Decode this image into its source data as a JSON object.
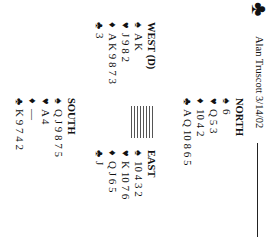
{
  "header": {
    "icon": "club-icon",
    "icon_glyph": "♣",
    "byline": "Alan Truscott 3/14/02"
  },
  "suits": {
    "spades": "♠",
    "hearts": "♥",
    "diamonds": "♦",
    "clubs": "♣"
  },
  "hands": {
    "north": {
      "name": "NORTH",
      "spades": "6",
      "hearts": "Q 5 3",
      "diamonds": "10 4 2",
      "clubs": "A Q 10 8 6 5"
    },
    "west": {
      "name": "WEST (D)",
      "spades": "A K",
      "hearts": "J 9 8 2",
      "diamonds": "A K 9 8 7 3",
      "clubs": "3"
    },
    "east": {
      "name": "EAST",
      "spades": "10 4 3 2",
      "hearts": "K 10 7 6",
      "diamonds": "Q J 6 5",
      "clubs": "J"
    },
    "south": {
      "name": "SOUTH",
      "spades": "Q J 9 8 7 5",
      "hearts": "A 4",
      "diamonds": "—",
      "clubs": "K 9 7 4 2"
    }
  }
}
